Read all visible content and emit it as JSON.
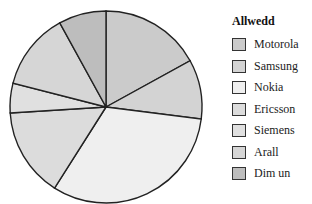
{
  "chart_data": {
    "type": "pie",
    "title": "",
    "legend_title": "Allwedd",
    "legend_position": "right",
    "categories": [
      "Motorola",
      "Samsung",
      "Nokia",
      "Ericsson",
      "Siemens",
      "Arall",
      "Dim un"
    ],
    "values": [
      17,
      10,
      32,
      15,
      5,
      13,
      8
    ],
    "colors": [
      "#cbcbcb",
      "#d3d3d3",
      "#efefef",
      "#dcdcdc",
      "#e0e0e0",
      "#d6d6d6",
      "#bdbdbd"
    ]
  },
  "legend": {
    "title": "Allwedd",
    "items": [
      {
        "label": "Motorola",
        "color": "#cbcbcb"
      },
      {
        "label": "Samsung",
        "color": "#d3d3d3"
      },
      {
        "label": "Nokia",
        "color": "#efefef"
      },
      {
        "label": "Ericsson",
        "color": "#dcdcdc"
      },
      {
        "label": "Siemens",
        "color": "#e0e0e0"
      },
      {
        "label": "Arall",
        "color": "#d6d6d6"
      },
      {
        "label": "Dim un",
        "color": "#bdbdbd"
      }
    ]
  }
}
